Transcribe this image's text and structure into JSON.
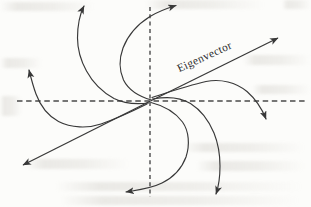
{
  "diagram": {
    "type": "phase-portrait",
    "label": "Eigenvector",
    "colors": {
      "curve": "#383838",
      "axis_dash": "#4a4a4a",
      "label_text": "#2e2e2e",
      "paper": "#fcfcfa"
    },
    "axes": {
      "horizontal": {
        "name": "horizontal-dashed-axis",
        "x1": 17,
        "y1": 101,
        "x2": 306,
        "y2": 101,
        "dash": "5.5 3.6",
        "width": 1.5
      },
      "vertical": {
        "name": "vertical-dashed-axis",
        "x1": 150,
        "y1": 7,
        "x2": 150,
        "y2": 197,
        "dash": "4 3.3",
        "width": 1.4
      }
    },
    "eigenvector": {
      "name": "eigenvector-line",
      "width": 1.25,
      "segments": [
        {
          "x1": 150.5,
          "y1": 101,
          "x2": 278,
          "y2": 38
        },
        {
          "x1": 150.5,
          "y1": 101,
          "x2": 23,
          "y2": 165
        }
      ]
    },
    "label_placement": {
      "x": 206,
      "y": 60,
      "rotate": -24.5
    },
    "trajectories": [
      {
        "name": "trajectory-upper-left-vertical",
        "d": "M148.5,103 C136,104.5 124,103.5 114,98.5 C104,93 93,83 86.5,71 C81,61 77.5,49 77.5,38 C77.5,27 79.5,15 84,6"
      },
      {
        "name": "trajectory-left-hook",
        "d": "M147,104 C134,110.5 118,118 101,124 C88,128.5 71,128 58.5,121.5 C47.5,115.5 40,105 36,94 C33,86 31,78 29,70"
      },
      {
        "name": "trajectory-top-loop",
        "d": "M151.5,100 C139,96.5 128.5,90 123.5,80 C119.5,71 119,59 123,48 C128,35 138,24 150,16.5 C158,11.5 166.5,8.5 176,5.5"
      },
      {
        "name": "trajectory-lower-right-vertical",
        "d": "M152.5,99 C166,96.5 180,97 190.5,103.5 C200,109.5 209,121 214,133 C218,143 220,155 220,166 C220,176 219,185.5 216,194"
      },
      {
        "name": "trajectory-right-hook",
        "d": "M152,97.5 C169,92 188,85.5 206,81.5 C221,78.5 236,82.5 247,91.5 C255,98.5 261.5,107.5 266,119"
      },
      {
        "name": "trajectory-bottom-loop",
        "d": "M151,102.5 C163,105.5 175,112 182.5,122 C189,131 190,145 186,157 C182,168 173,177.5 162,183 C151,188.5 138,190 126,192"
      }
    ],
    "arrowhead": {
      "length": 8.5,
      "half_width": 3.5
    }
  }
}
